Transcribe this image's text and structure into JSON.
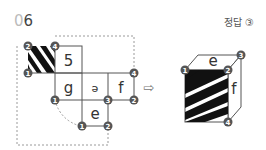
{
  "question": {
    "number_prefix": "0",
    "number_suffix": "6"
  },
  "answer": {
    "label": "정답 ③"
  },
  "net": {
    "faces": [
      {
        "id": "striped",
        "label": "",
        "pattern": "diagonal-stripes"
      },
      {
        "id": "top",
        "label": "5"
      },
      {
        "id": "left",
        "label": "g"
      },
      {
        "id": "center",
        "label": "ə"
      },
      {
        "id": "right",
        "label": "f"
      },
      {
        "id": "bottom",
        "label": "e"
      }
    ],
    "vertex_markers": [
      "2",
      "4",
      "1",
      "4",
      "1",
      "3",
      "2",
      "1",
      "2"
    ]
  },
  "arrow": {
    "glyph": "⇨"
  },
  "cube": {
    "top_label": "e",
    "side_label": "f",
    "vertex_markers": [
      "1",
      "2",
      "3",
      "4"
    ]
  },
  "colors": {
    "marker": "#555555",
    "line": "#555555",
    "dotted": "#999999",
    "stripe": "#111111"
  }
}
